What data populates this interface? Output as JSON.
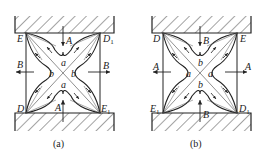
{
  "figure": {
    "panels": [
      {
        "id": "a",
        "caption": "(a)",
        "corners": {
          "top_left": "E",
          "top_right": "D",
          "top_right_sub": "1",
          "bottom_left": "D",
          "bottom_left_sub": "",
          "bottom_right": "E",
          "bottom_right_sub": "1"
        },
        "arrow_vertical_label": "A",
        "arrow_horizontal_label": "B",
        "region_top": "a",
        "region_bottom": "a",
        "region_left": "b",
        "region_right": "b"
      },
      {
        "id": "b",
        "caption": "(b)",
        "corners": {
          "top_left": "D",
          "top_right": "E",
          "top_right_sub": "",
          "bottom_left": "E",
          "bottom_left_sub": "1",
          "bottom_right": "D",
          "bottom_right_sub": "1"
        },
        "arrow_vertical_label": "B",
        "arrow_horizontal_label": "A",
        "region_top": "b",
        "region_bottom": "b",
        "region_left": "a",
        "region_right": "a"
      }
    ],
    "colors": {
      "line": "#222222",
      "hatch": "#333333",
      "background": "#ffffff"
    }
  }
}
